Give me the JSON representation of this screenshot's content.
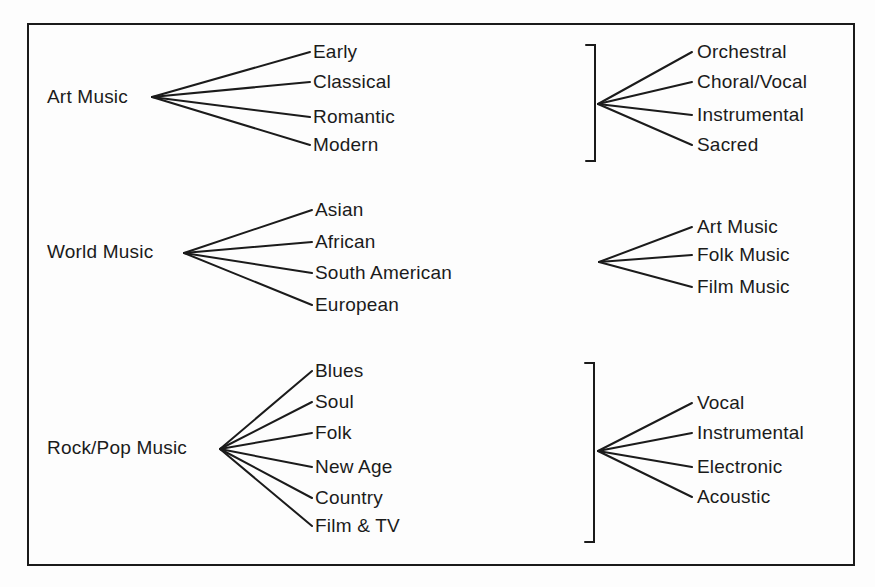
{
  "diagram": {
    "line_color": "#1b1b1b",
    "background": "#fdfdfd",
    "left_trees": [
      {
        "root": "Art Music",
        "children": [
          "Early",
          "Classical",
          "Romantic",
          "Modern"
        ]
      },
      {
        "root": "World Music",
        "children": [
          "Asian",
          "African",
          "South American",
          "European"
        ]
      },
      {
        "root": "Rock/Pop Music",
        "children": [
          "Blues",
          "Soul",
          "Folk",
          "New Age",
          "Country",
          "Film & TV"
        ]
      }
    ],
    "right_trees": [
      {
        "bracket": true,
        "children": [
          "Orchestral",
          "Choral/Vocal",
          "Instrumental",
          "Sacred"
        ]
      },
      {
        "bracket": false,
        "children": [
          "Art Music",
          "Folk Music",
          "Film Music"
        ]
      },
      {
        "bracket": true,
        "children": [
          "Vocal",
          "Instrumental",
          "Electronic",
          "Acoustic"
        ]
      }
    ]
  }
}
